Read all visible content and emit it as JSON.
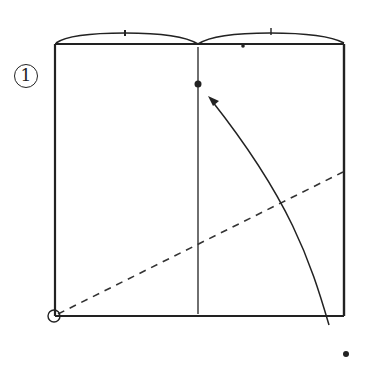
{
  "diagram": {
    "type": "folding-instruction",
    "step": {
      "number": "1",
      "label_style": "circled-number"
    },
    "colors": {
      "ink": "#222222",
      "background": "#ffffff"
    },
    "elements": {
      "paper": "square sheet with top edge bulging into two arcs",
      "center_crease": "vertical line at horizontal center",
      "fold_line": "dashed valley line from bottom-left corner to right edge",
      "target_point": "dot on center crease near top",
      "corner_marker": "dot outside bottom-right corner",
      "pivot_marker": "small circle at bottom-left corner",
      "arrow": "curved arrow from bottom-right corner up to target point on center crease"
    }
  }
}
